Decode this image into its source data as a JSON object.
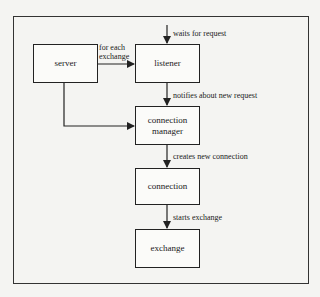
{
  "diagram": {
    "nodes": [
      {
        "id": "server",
        "label": "server"
      },
      {
        "id": "listener",
        "label": "listener"
      },
      {
        "id": "connection_manager",
        "label": "connection manager"
      },
      {
        "id": "connection",
        "label": "connection"
      },
      {
        "id": "exchange",
        "label": "exchange"
      }
    ],
    "edges": [
      {
        "from": "external",
        "to": "listener",
        "label": "waits for request"
      },
      {
        "from": "server",
        "to": "listener",
        "label_line1": "for each",
        "label_line2": "exchange"
      },
      {
        "from": "server",
        "to": "connection_manager",
        "label": ""
      },
      {
        "from": "listener",
        "to": "connection_manager",
        "label": "notifies about new request"
      },
      {
        "from": "connection_manager",
        "to": "connection",
        "label": "creates new connection"
      },
      {
        "from": "connection",
        "to": "exchange",
        "label": "starts exchange"
      }
    ]
  }
}
